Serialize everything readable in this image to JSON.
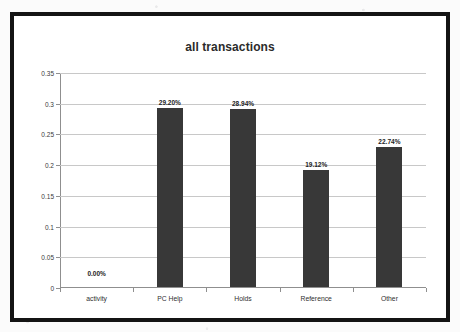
{
  "chart_data": {
    "type": "bar",
    "title": "all transactions",
    "xlabel": "",
    "ylabel": "",
    "categories": [
      "activity",
      "PC Help",
      "Holds",
      "Reference",
      "Other"
    ],
    "values": [
      0.0,
      0.292,
      0.2894,
      0.1912,
      0.2274
    ],
    "data_labels": [
      "0.00%",
      "29.20%",
      "28.94%",
      "19.12%",
      "22.74%"
    ],
    "ylim": [
      0,
      0.35
    ],
    "ytick_labels": [
      "0",
      "0.05",
      "0.1",
      "0.15",
      "0.2",
      "0.25",
      "0.3",
      "0.35"
    ],
    "ytick_values": [
      0,
      0.05,
      0.1,
      0.15,
      0.2,
      0.25,
      0.3,
      0.35
    ],
    "grid": true,
    "legend": false,
    "legend_position": "none",
    "series": [
      {
        "name": "all transactions",
        "values": [
          0.0,
          0.292,
          0.2894,
          0.1912,
          0.2274
        ]
      }
    ],
    "colors": {
      "bar": "#383838",
      "gridline": "#c8c8c8",
      "axis": "#8f8f8f",
      "text": "#2b2b2b",
      "plot_background": "#ffffff",
      "frame": "#141414"
    }
  }
}
